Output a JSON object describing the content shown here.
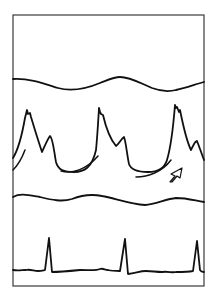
{
  "figure": {
    "type": "physiological-tracing",
    "width": 217,
    "height": 301,
    "colors": {
      "background": "#ffffff",
      "frame": "#3a3a3a",
      "trace": "#111111"
    },
    "frame": {
      "x": 13,
      "y": 15,
      "width": 191,
      "height": 271
    },
    "traces": [
      {
        "name": "respiratory-trace-top",
        "d": "M13,79 C30,78 45,84 58,88 C72,92 88,88 100,83 C108,80 114,77 120,77 C130,77 140,83 152,88 C160,91 168,92 176,90 C186,88 196,84 204,82"
      },
      {
        "name": "pressure-waveform",
        "d": "M13,158 C18,150 22,135 25,118 L27,110 L28,114 L30,113 L31,117 C34,127 38,140 42,152 C44,148 47,140 50,136 C53,138 54,152 56,162 C58,170 64,172 74,172 C84,172 92,168 96,150 C97,140 98,125 99,108 L100,112 L101,114 L103,115 C106,128 111,140 116,146 C119,144 121,139 124,137 C126,142 127,155 129,164 C131,170 138,172 148,172 C156,172 164,170 167,160 C170,150 173,130 175,105 L176,108 L177,107 L179,112 L180,110 C183,125 187,142 191,150 C193,146 195,141 197,141 C199,146 201,152 204,160"
      },
      {
        "name": "pressure-artifact-left",
        "d": "M13,170 C18,165 22,158 25,150"
      },
      {
        "name": "pressure-artifact-mid",
        "d": "M61,171 C72,174 86,170 98,156"
      },
      {
        "name": "pressure-artifact-right",
        "d": "M136,177 C148,177 162,172 171,160"
      },
      {
        "name": "respiratory-trace-bottom",
        "d": "M13,197 C20,193 28,195 40,197 C52,200 62,202 72,199 C82,195 92,194 102,196 C114,198 130,204 145,205 C156,204 166,199 176,198 C188,198 196,201 204,202"
      },
      {
        "name": "ecg-trace",
        "d": "M13,270 C18,271 22,270 26,270 C30,269 34,271 38,271 C42,271 44,270 45,270 L49,238 L52,272 C60,272 70,271 80,270 C90,270 96,271 100,269 C103,268 105,270 108,270 C112,271 118,271 120,271 L125,239 L128,274 C136,273 140,271 146,271 C152,271 156,272 162,272 C168,271 172,273 176,272 C182,272 188,272 193,271 L197,241 L200,270 C201,272 202,272 204,272"
      }
    ],
    "annotation_arrow": {
      "name": "arrow-marker",
      "direction": "up-right",
      "d": "M170,182 L175,176 L171,174 L182,168 L180,178 L177,176 L172,182 Z"
    }
  }
}
